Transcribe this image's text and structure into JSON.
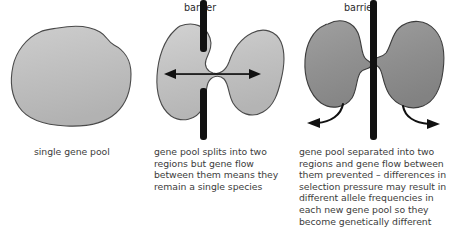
{
  "diagram": {
    "background": "#ffffff",
    "panels": [
      {
        "id": "single-pool",
        "caption": "single gene pool",
        "barrier_label": "",
        "blob_fill": "#bcbcbc",
        "blob_stroke": "#4a4a4a",
        "barrier": "none",
        "arrow": "none"
      },
      {
        "id": "split-with-gene-flow",
        "caption": "gene pool splits into two\nregions but gene flow\nbetween them means they\nremain a single species",
        "barrier_label": "barrier",
        "blob_fill": "#c2c2c2",
        "blob_stroke": "#4a4a4a",
        "barrier": "split-with-gap",
        "arrow": "double-headed-horizontal"
      },
      {
        "id": "separated-no-gene-flow",
        "caption": "gene pool separated into two\nregions and gene flow between\nthem prevented – differences in\nselection pressure may result in\ndifferent allele frequencies in\neach new gene pool so they\nbecome genetically different",
        "barrier_label": "barrier",
        "blob_fill": "#909090",
        "blob_stroke": "#3c3c3c",
        "barrier": "continuous",
        "arrow": "two-curved-outward"
      }
    ],
    "colors": {
      "barrier": "#111111",
      "arrow": "#111111",
      "text": "#3c3c3c",
      "label": "#2b2b2b"
    }
  }
}
